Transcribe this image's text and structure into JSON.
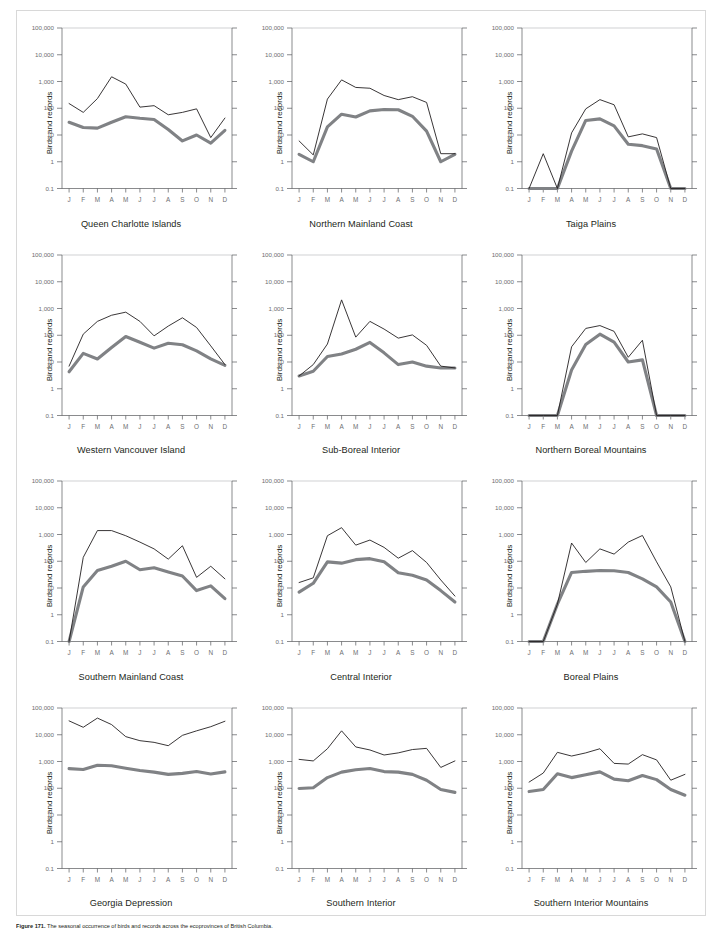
{
  "figure": {
    "caption_label": "Figure 171.",
    "caption_text": "The seasonal occurrence of birds and records across the ecoprovinces of British Columbia."
  },
  "axes": {
    "ylabel": "Birds and records",
    "yticks": [
      "100,000",
      "10,000",
      "1,000",
      "100",
      "10",
      "1",
      "0.1"
    ],
    "xticks": [
      "J",
      "F",
      "M",
      "A",
      "M",
      "J",
      "J",
      "A",
      "S",
      "O",
      "N",
      "D"
    ],
    "ymin": 0.1,
    "ymax": 100000
  },
  "colors": {
    "records_line": "#231f20",
    "birds_line": "#808285",
    "axis": "#58595b",
    "grid": "#bcbdc0",
    "frame": "#d8d8d8"
  },
  "chart_data": {
    "type": "line",
    "xlabel": "",
    "ylabel": "Birds and records",
    "ylim": [
      0.1,
      100000
    ],
    "yscale": "log",
    "grid": false,
    "legend": "none",
    "categories": [
      "J",
      "F",
      "M",
      "A",
      "M",
      "J",
      "J",
      "A",
      "S",
      "O",
      "N",
      "D"
    ],
    "panels": [
      {
        "title": "Queen Charlotte Islands",
        "series": [
          {
            "name": "records",
            "values": [
              150,
              70,
              230,
              1500,
              800,
              110,
              125,
              57,
              70,
              95,
              8,
              43
            ]
          },
          {
            "name": "birds",
            "values": [
              30,
              19,
              18,
              30,
              48,
              42,
              38,
              16,
              6,
              10,
              5,
              15
            ]
          }
        ]
      },
      {
        "title": "Northern Mainland Coast",
        "series": [
          {
            "name": "records",
            "values": [
              6,
              1.8,
              220,
              1150,
              600,
              560,
              300,
              210,
              270,
              165,
              2,
              2
            ]
          },
          {
            "name": "birds",
            "values": [
              1.9,
              1.0,
              20,
              60,
              47,
              80,
              90,
              88,
              50,
              14,
              1,
              1.9
            ]
          }
        ]
      },
      {
        "title": "Taiga Plains",
        "series": [
          {
            "name": "records",
            "values": [
              0.1,
              2,
              0.1,
              12,
              95,
              210,
              135,
              8.5,
              11,
              8,
              0.1,
              0.1
            ]
          },
          {
            "name": "birds",
            "values": [
              0.1,
              0.1,
              0.1,
              2.5,
              35,
              40,
              22,
              4.5,
              4,
              3,
              0.1,
              0.1
            ]
          }
        ]
      },
      {
        "title": "Western Vancouver Island",
        "series": [
          {
            "name": "records",
            "values": [
              7,
              110,
              330,
              560,
              730,
              330,
              95,
              220,
              450,
              195,
              40,
              8
            ]
          },
          {
            "name": "birds",
            "values": [
              4.3,
              21,
              13,
              35,
              90,
              55,
              33,
              50,
              44,
              26,
              13,
              7.5
            ]
          }
        ]
      },
      {
        "title": "Sub-Boreal Interior",
        "series": [
          {
            "name": "records",
            "values": [
              3,
              8,
              47,
              2100,
              85,
              330,
              170,
              78,
              103,
              42,
              7,
              6
            ]
          },
          {
            "name": "birds",
            "values": [
              3,
              4.5,
              16,
              20,
              30,
              54,
              22,
              8,
              10,
              7,
              6,
              6
            ]
          }
        ]
      },
      {
        "title": "Northern Boreal Mountains",
        "series": [
          {
            "name": "records",
            "values": [
              0.1,
              0.1,
              0.1,
              37,
              180,
              230,
              140,
              15,
              65,
              0.1,
              0.1,
              0.1
            ]
          },
          {
            "name": "birds",
            "values": [
              0.1,
              0.1,
              0.1,
              5,
              45,
              110,
              55,
              10,
              12,
              0.1,
              0.1,
              0.1
            ]
          }
        ]
      },
      {
        "title": "Southern Mainland Coast",
        "series": [
          {
            "name": "records",
            "values": [
              0.1,
              140,
              1400,
              1400,
              900,
              520,
              290,
              120,
              380,
              25,
              65,
              22
            ]
          },
          {
            "name": "birds",
            "values": [
              0.1,
              11,
              45,
              65,
              100,
              48,
              57,
              40,
              28,
              8,
              12,
              4
            ]
          }
        ]
      },
      {
        "title": "Central Interior",
        "series": [
          {
            "name": "records",
            "values": [
              16,
              24,
              900,
              1800,
              400,
              620,
              330,
              130,
              250,
              90,
              20,
              5
            ]
          },
          {
            "name": "birds",
            "values": [
              7,
              15,
              95,
              85,
              115,
              125,
              95,
              37,
              30,
              20,
              8,
              3
            ]
          }
        ]
      },
      {
        "title": "Boreal Plains",
        "series": [
          {
            "name": "records",
            "values": [
              0.1,
              0.1,
              2.5,
              480,
              90,
              290,
              185,
              520,
              920,
              95,
              11,
              0.1
            ]
          },
          {
            "name": "birds",
            "values": [
              0.1,
              0.1,
              2.5,
              38,
              42,
              45,
              44,
              38,
              22,
              11,
              3,
              0.1
            ]
          }
        ]
      },
      {
        "title": "Georgia Depression",
        "series": [
          {
            "name": "records",
            "values": [
              33000,
              19000,
              42000,
              24000,
              8500,
              6000,
              5200,
              3900,
              9500,
              14000,
              20000,
              32000
            ]
          },
          {
            "name": "birds",
            "values": [
              540,
              500,
              720,
              690,
              560,
              460,
              400,
              330,
              360,
              420,
              340,
              410
            ]
          }
        ]
      },
      {
        "title": "Southern Interior",
        "series": [
          {
            "name": "records",
            "values": [
              1200,
              1050,
              3000,
              14000,
              3500,
              2700,
              1750,
              2100,
              2800,
              3100,
              600,
              1050
            ]
          },
          {
            "name": "birds",
            "values": [
              98,
              105,
              250,
              400,
              490,
              550,
              420,
              400,
              330,
              200,
              90,
              70
            ]
          }
        ]
      },
      {
        "title": "Southern Interior Mountains",
        "series": [
          {
            "name": "records",
            "values": [
              170,
              370,
              2200,
              1600,
              2100,
              3000,
              850,
              800,
              1800,
              1150,
              200,
              330
            ]
          },
          {
            "name": "birds",
            "values": [
              75,
              90,
              350,
              250,
              320,
              410,
              220,
              190,
              300,
              210,
              90,
              55
            ]
          }
        ]
      }
    ]
  }
}
